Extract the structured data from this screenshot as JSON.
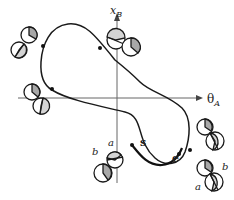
{
  "axes": {
    "x_label": "θ",
    "x_sub": "A",
    "y_label": "x",
    "y_sub": "B"
  },
  "points": {
    "start": "s",
    "end": "e"
  },
  "disc_labels": {
    "bottom_left_a": "a",
    "bottom_left_b": "b",
    "bottom_right_a": "a",
    "bottom_right_b": "b"
  },
  "colors": {
    "stroke": "#1a1a1a",
    "dark_fill": "#a8a8a8",
    "light_fill": "#d4d4d4",
    "axis": "#555555"
  }
}
